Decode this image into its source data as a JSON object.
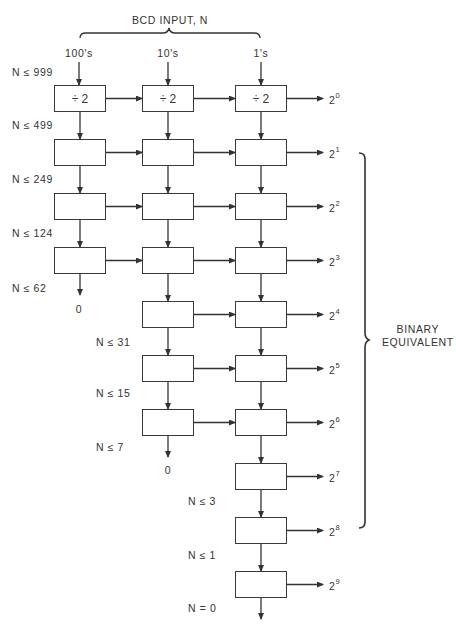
{
  "title": "BCD INPUT, N",
  "columns": [
    {
      "label": "100's",
      "x": 79
    },
    {
      "label": "10's",
      "x": 168
    },
    {
      "label": "1's",
      "x": 261
    }
  ],
  "divider_label": "÷ 2",
  "condition_labels": [
    {
      "text": "N ≤ 999",
      "x": 12,
      "y": 66
    },
    {
      "text": "N ≤ 499",
      "x": 12,
      "y": 119
    },
    {
      "text": "N ≤ 249",
      "x": 12,
      "y": 173
    },
    {
      "text": "N ≤ 124",
      "x": 12,
      "y": 227
    },
    {
      "text": "N ≤ 62",
      "x": 12,
      "y": 282
    },
    {
      "text": "N ≤ 31",
      "x": 96,
      "y": 336
    },
    {
      "text": "N ≤ 15",
      "x": 96,
      "y": 387
    },
    {
      "text": "N ≤ 7",
      "x": 96,
      "y": 441
    },
    {
      "text": "N ≤ 3",
      "x": 188,
      "y": 495
    },
    {
      "text": "N ≤ 1",
      "x": 188,
      "y": 549
    },
    {
      "text": "N = 0",
      "x": 188,
      "y": 602
    }
  ],
  "zero_outputs": [
    {
      "text": "0",
      "x": 79,
      "y": 303
    },
    {
      "text": "0",
      "x": 168,
      "y": 464
    }
  ],
  "outputs": [
    {
      "base": "2",
      "exp": "0"
    },
    {
      "base": "2",
      "exp": "1"
    },
    {
      "base": "2",
      "exp": "2"
    },
    {
      "base": "2",
      "exp": "3"
    },
    {
      "base": "2",
      "exp": "4"
    },
    {
      "base": "2",
      "exp": "5"
    },
    {
      "base": "2",
      "exp": "6"
    },
    {
      "base": "2",
      "exp": "7"
    },
    {
      "base": "2",
      "exp": "8"
    },
    {
      "base": "2",
      "exp": "9"
    }
  ],
  "brace_label_line1": "BINARY",
  "brace_label_line2": "EQUIVALENT",
  "grid": {
    "row_tops": [
      85,
      139,
      193,
      247,
      301,
      355,
      409,
      463,
      517,
      571
    ],
    "box_height": 27,
    "box_width": 52,
    "col_lefts": [
      54,
      142,
      235
    ],
    "rows_per_column": [
      [
        0,
        3
      ],
      [
        0,
        6
      ],
      [
        0,
        9
      ]
    ]
  },
  "colors": {
    "line": "#333333",
    "background": "#ffffff"
  }
}
